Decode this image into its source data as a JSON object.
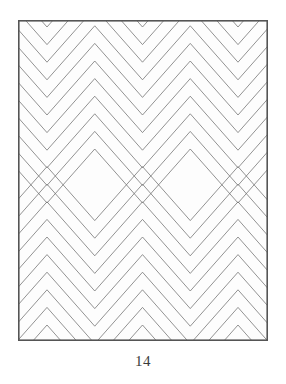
{
  "figure": {
    "caption": "14",
    "caption_label": "figure-number",
    "background_color": "#ffffff",
    "plate_background": "#fdfdfd"
  },
  "frame": {
    "x": 18,
    "y": 20,
    "width": 250,
    "height": 321,
    "stroke_color": "#555555",
    "stroke_width": 1.6,
    "fill": "#fdfdfd"
  },
  "chart_data": {
    "type": "line",
    "title": "14",
    "subtitle": "",
    "xlabel": "",
    "ylabel": "",
    "grid": false,
    "legend_position": "none",
    "plot_area": {
      "x": 0,
      "y": 0,
      "width": 250,
      "height": 321
    },
    "xlim": [
      0,
      250
    ],
    "ylim": [
      0,
      321
    ],
    "pattern": {
      "kind": "nested-chevrons",
      "horizontal_period": 95.5,
      "vertical_spacing": 17.6,
      "mirror_axis_y": 156,
      "valley_x_positions": [
        29,
        124.5,
        220,
        315.5
      ],
      "peak_x_positions": [
        -18.75,
        76.75,
        172.25,
        267.75
      ],
      "chevron_half_width": 47.75,
      "chevron_amplitude": 27.0,
      "upper_rows": 9,
      "lower_rows": 10,
      "diamond_centers": [
        {
          "cx": 76.75,
          "cy": 156
        },
        {
          "cx": 172.25,
          "cy": 156
        }
      ],
      "crossing_points": [
        {
          "cx": 29,
          "cy": 156
        },
        {
          "cx": 124.5,
          "cy": 156
        },
        {
          "cx": 220,
          "cy": 156
        }
      ],
      "stroke_color": "#6f6f6f",
      "stroke_width": 0.75
    }
  },
  "colors": {
    "line": "#6f6f6f",
    "frame": "#555555",
    "caption": "#3b3b3b",
    "paper": "#ffffff"
  }
}
